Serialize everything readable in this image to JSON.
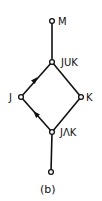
{
  "figure": {
    "caption": "(b)",
    "type": "lattice / Hasse diagram"
  },
  "nodes": [
    {
      "id": "M",
      "label": "M",
      "x": 52,
      "y": 21
    },
    {
      "id": "JUK",
      "label": "JUK",
      "x": 52,
      "y": 62
    },
    {
      "id": "J",
      "label": "J",
      "x": 21,
      "y": 97
    },
    {
      "id": "K",
      "label": "K",
      "x": 81,
      "y": 97
    },
    {
      "id": "JnK",
      "label": "JΛK",
      "x": 52,
      "y": 132
    },
    {
      "id": "bottom",
      "label": "",
      "x": 51,
      "y": 172
    }
  ],
  "edges": [
    {
      "from": "JUK",
      "to": "M",
      "arrow": false
    },
    {
      "from": "J",
      "to": "JUK",
      "arrow": true
    },
    {
      "from": "K",
      "to": "JUK",
      "arrow": false
    },
    {
      "from": "JnK",
      "to": "J",
      "arrow": true
    },
    {
      "from": "JnK",
      "to": "K",
      "arrow": false
    },
    {
      "from": "bottom",
      "to": "JnK",
      "arrow": false
    }
  ],
  "colors": {
    "ink": "#111111",
    "background": "#ffffff"
  }
}
